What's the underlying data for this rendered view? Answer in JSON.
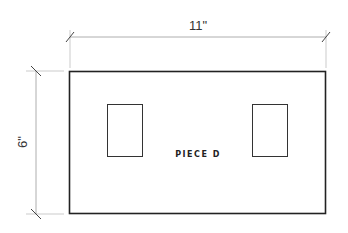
{
  "diagram": {
    "piece_label": "PIECE D",
    "width_dimension": "11\"",
    "height_dimension": "6\"",
    "colors": {
      "outline": "#222222",
      "dimension_line": "#999999",
      "background": "#ffffff"
    }
  }
}
